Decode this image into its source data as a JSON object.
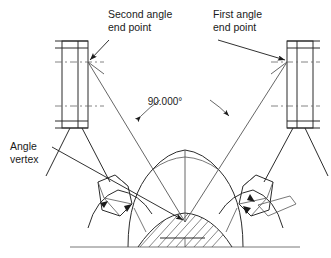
{
  "diagram": {
    "background_color": "#ffffff",
    "line_color": "#2b2b2b",
    "text_color": "#1a1a1a",
    "annotations": [
      {
        "id": "second-angle-end-point",
        "line1": "Second angle",
        "line2": "end point",
        "text_x": 108,
        "text_y": 18,
        "leader_from_x": 109,
        "leader_from_y": 40,
        "leader_to_x": 88,
        "leader_to_y": 62
      },
      {
        "id": "first-angle-end-point",
        "line1": "First angle",
        "line2": "end point",
        "text_x": 213,
        "text_y": 18,
        "leader_from_x": 218,
        "leader_from_y": 40,
        "leader_to_x": 287,
        "leader_to_y": 62
      },
      {
        "id": "angle-vertex",
        "line1": "Angle",
        "line2": "vertex",
        "text_x": 10,
        "text_y": 150,
        "leader_from_x": 52,
        "leader_from_y": 151,
        "leader_to_x": 185,
        "leader_to_y": 222
      }
    ],
    "dimension": {
      "id": "angle-dimension",
      "value": "90.000",
      "unit": "°",
      "label": "90.000°",
      "text_x": 165,
      "text_y": 105,
      "vertex_x": 185,
      "vertex_y": 222,
      "arc_radius": 124
    },
    "angle_legs": [
      {
        "id": "leg-to-second-end-point",
        "x1": 185,
        "y1": 222,
        "x2": 88,
        "y2": 62
      },
      {
        "id": "leg-to-first-end-point",
        "x1": 185,
        "y1": 222,
        "x2": 287,
        "y2": 62
      }
    ],
    "end_point_markers": [
      {
        "id": "left-end-point-marker",
        "x": 88,
        "y": 62
      },
      {
        "id": "right-end-point-marker",
        "x": 287,
        "y": 62
      }
    ],
    "parts": [
      {
        "id": "left-bracket",
        "x": 62,
        "y": 41,
        "width": 26,
        "height": 87
      },
      {
        "id": "right-bracket",
        "x": 287,
        "y": 41,
        "width": 26,
        "height": 87
      },
      {
        "id": "left-gear-tooth",
        "label": "gear tooth profile"
      },
      {
        "id": "right-gear-tooth",
        "label": "gear tooth profile"
      },
      {
        "id": "center-hatched-section",
        "label": "sectioned hub"
      }
    ]
  }
}
